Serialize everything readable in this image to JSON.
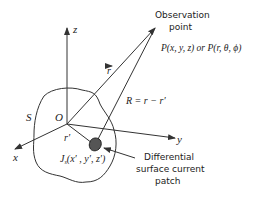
{
  "diagram": {
    "axes": {
      "x_label": "x",
      "y_label": "y",
      "z_label": "z",
      "origin_label": "O"
    },
    "surface_label": "S",
    "observation": {
      "title_line1": "Observation",
      "title_line2": "point",
      "coords": "P(x, y, z) or P(r, θ, ϕ)"
    },
    "vectors": {
      "r": "r",
      "r_prime": "r′",
      "R_eq": "R = r − r′"
    },
    "current": {
      "label": "J",
      "sub": "s",
      "args": "(x′ , y′, z′)"
    },
    "patch_label": {
      "line1": "Differential",
      "line2": "surface current",
      "line3": "patch"
    },
    "colors": {
      "line": "#333333",
      "patch_fill": "#555555",
      "background": "#ffffff"
    }
  }
}
